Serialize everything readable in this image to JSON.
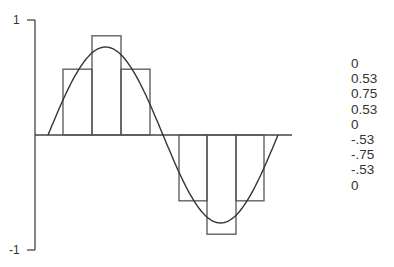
{
  "chart_data": {
    "type": "bar",
    "title": "",
    "xlabel": "",
    "ylabel": "",
    "ylim": [
      -1,
      1
    ],
    "y_tick_labels": [
      "1",
      "-1"
    ],
    "grid": false,
    "categories": [
      "1",
      "2",
      "3",
      "4",
      "5",
      "6",
      "7",
      "8"
    ],
    "series": [
      {
        "name": "sampled bars",
        "values": [
          0.53,
          0.75,
          0.53,
          0,
          -0.53,
          -0.75,
          -0.53,
          0
        ]
      },
      {
        "name": "sine curve",
        "type": "line",
        "function": "sin",
        "amplitude": 0.75,
        "periods": 1
      }
    ],
    "sample_values": [
      "0",
      "0.53",
      "0.75",
      "0.53",
      "0",
      "-.53",
      "-.75",
      "-.53",
      "0"
    ]
  },
  "axis": {
    "top_label": "1",
    "bottom_label": "-1"
  },
  "values_list": [
    "0",
    "0.53",
    "0.75",
    "0.53",
    "0",
    "-.53",
    "-.75",
    "-.53",
    "0"
  ],
  "colors": {
    "line": "#333333",
    "bar_stroke": "#555555",
    "background": "#ffffff"
  }
}
